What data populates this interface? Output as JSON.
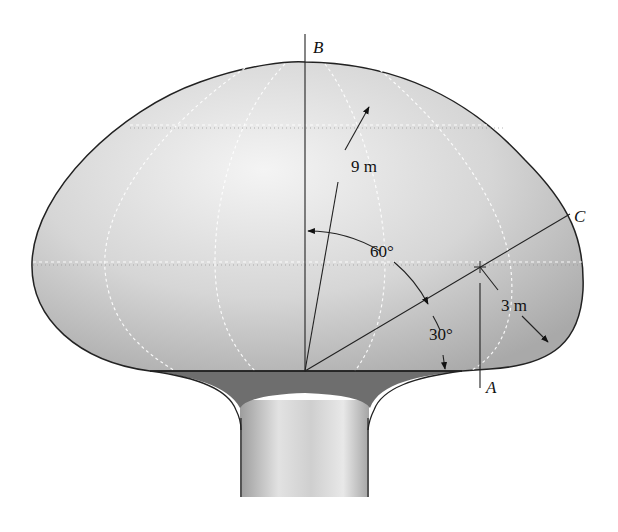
{
  "figure": {
    "labels": {
      "point_b": "B",
      "point_a": "A",
      "point_c": "C",
      "dim_radius_large": "9 m",
      "dim_radius_small": "3 m",
      "angle_large": "60°",
      "angle_small": "30°"
    },
    "colors": {
      "dome_light": "#efefef",
      "dome_mid": "#c9c9c9",
      "dome_dark": "#a8a8a8",
      "base_band": "#6f6f6f",
      "column_light": "#e6e6e6",
      "column_dark": "#9a9a9a",
      "outline": "#222222",
      "seam": "#ffffff"
    }
  }
}
